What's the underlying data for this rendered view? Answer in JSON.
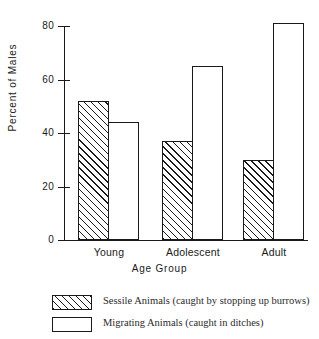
{
  "chart_data": {
    "type": "bar",
    "title": "",
    "categories": [
      "Young",
      "Adolescent",
      "Adult"
    ],
    "series": [
      {
        "name": "Sessile Animals (caught by stopping up burrows)",
        "pattern": "hatched",
        "values": [
          52,
          37,
          30
        ]
      },
      {
        "name": "Migrating Animals (caught in ditches)",
        "pattern": "open",
        "values": [
          44,
          65,
          81
        ]
      }
    ],
    "xlabel": "Age  Group",
    "ylabel": "Percent  of  Males",
    "ylim": [
      0,
      80
    ],
    "yticks": [
      0,
      20,
      40,
      60,
      80
    ],
    "ytick_labels": [
      "0",
      "20",
      "40",
      "60",
      "80"
    ],
    "grid": false,
    "legend_position": "bottom-left",
    "colors": {
      "ink": "#1a1a1a",
      "background": "#ffffff",
      "bar_fill": "#ffffff",
      "hatch": "#1a1a1a"
    }
  },
  "axes": {
    "y_title": "Percent  of  Males",
    "x_title": "Age  Group",
    "ticks": [
      {
        "label": "80",
        "value": 80
      },
      {
        "label": "60",
        "value": 60
      },
      {
        "label": "40",
        "value": 40
      },
      {
        "label": "20",
        "value": 20
      },
      {
        "label": "0",
        "value": 0
      }
    ]
  },
  "groups": [
    {
      "label": "Young",
      "sessile": 52,
      "migrating": 44
    },
    {
      "label": "Adolescent",
      "sessile": 37,
      "migrating": 65
    },
    {
      "label": "Adult",
      "sessile": 30,
      "migrating": 81
    }
  ],
  "legend": {
    "items": [
      {
        "swatch": "hatched-swatch",
        "label": "Sessile Animals (caught by stopping up burrows)"
      },
      {
        "swatch": "open-swatch",
        "label": "Migrating Animals (caught in ditches)"
      }
    ]
  }
}
